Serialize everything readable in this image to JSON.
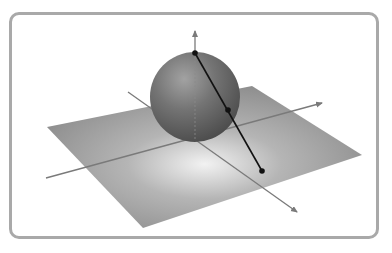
{
  "figure": {
    "colors": {
      "frame_border": "#a9a9a9",
      "plane": "#8c8c8c",
      "sphere": "#6e6e6e",
      "axis": "#7a7a7a",
      "line": "#111111"
    },
    "elements": {
      "plane": "ground-plane",
      "sphere": "sphere",
      "axes": [
        "vertical-axis",
        "x-axis",
        "y-axis"
      ],
      "points": [
        "north-pole-point",
        "sphere-intersection-point",
        "plane-projection-point"
      ],
      "projection_line": "line from north pole through sphere to plane"
    }
  }
}
